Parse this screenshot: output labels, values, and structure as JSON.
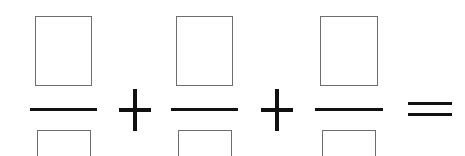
{
  "worksheet": {
    "type": "fraction-addition-equation",
    "background_color": "#ffffff",
    "ink_color": "#111111",
    "box_border_color": "#6e6e6e",
    "expression": "□/□ + □/□ + □/□ =",
    "terms": [
      {
        "index": 1,
        "numerator_value": "",
        "numerator_placeholder": "",
        "denominator_value": "",
        "denominator_placeholder": "",
        "left": 30,
        "box_left": 35,
        "box_width": 57,
        "bar_width": 67
      },
      {
        "index": 2,
        "numerator_value": "",
        "numerator_placeholder": "",
        "denominator_value": "",
        "denominator_placeholder": "",
        "left": 171,
        "box_left": 176,
        "box_width": 57,
        "bar_width": 67
      },
      {
        "index": 3,
        "numerator_value": "",
        "numerator_placeholder": "",
        "denominator_value": "",
        "denominator_placeholder": "",
        "left": 315,
        "box_left": 320,
        "box_width": 58,
        "bar_width": 68
      }
    ],
    "operators": [
      {
        "index": 1,
        "symbol": "+",
        "name": "plus",
        "left": 119
      },
      {
        "index": 2,
        "symbol": "+",
        "name": "plus",
        "left": 261
      },
      {
        "index": 3,
        "symbol": "=",
        "name": "equals",
        "left": 408
      }
    ]
  }
}
